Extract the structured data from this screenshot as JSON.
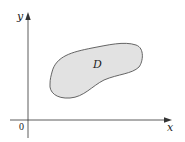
{
  "diagram": {
    "type": "region-in-plane",
    "labels": {
      "x_axis": "x",
      "y_axis": "y",
      "origin": "0",
      "region": "D"
    },
    "colors": {
      "region_fill": "#e2e2e2",
      "region_stroke": "#555555",
      "axis": "#333333"
    }
  }
}
